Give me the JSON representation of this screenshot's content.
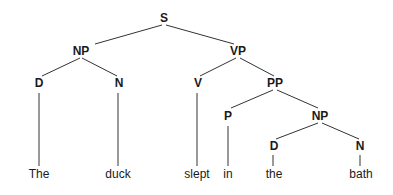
{
  "diagram": {
    "type": "parse-tree",
    "sentence": "The duck slept in the bath",
    "nodes": {
      "s": {
        "label": "S",
        "x": 164,
        "y": 22
      },
      "np1": {
        "label": "NP",
        "x": 81,
        "y": 55
      },
      "vp": {
        "label": "VP",
        "x": 238,
        "y": 55
      },
      "d1": {
        "label": "D",
        "x": 39,
        "y": 87
      },
      "n1": {
        "label": "N",
        "x": 119,
        "y": 87
      },
      "v": {
        "label": "V",
        "x": 198,
        "y": 87
      },
      "pp": {
        "label": "PP",
        "x": 275,
        "y": 87
      },
      "p": {
        "label": "P",
        "x": 228,
        "y": 120
      },
      "np2": {
        "label": "NP",
        "x": 320,
        "y": 120
      },
      "d2": {
        "label": "D",
        "x": 274,
        "y": 150
      },
      "n2": {
        "label": "N",
        "x": 360,
        "y": 150
      }
    },
    "words": [
      {
        "text": "The",
        "x": 39
      },
      {
        "text": "duck",
        "x": 118
      },
      {
        "text": "slept",
        "x": 197
      },
      {
        "text": "in",
        "x": 228
      },
      {
        "text": "the",
        "x": 274
      },
      {
        "text": "bath",
        "x": 361
      }
    ],
    "word_y": 178
  }
}
